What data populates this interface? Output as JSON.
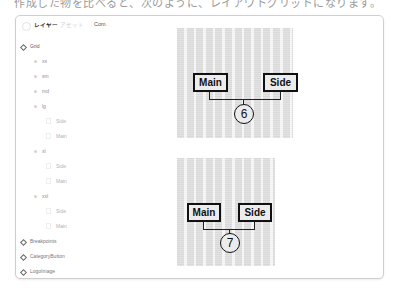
{
  "top_cut_text": "作成した物を比べると、次のように、レイアウトグリッドになります。",
  "header": {
    "tabs": [
      {
        "label": "レイヤー",
        "active": true
      },
      {
        "label": "アセット",
        "active": false
      }
    ],
    "chip_label": "Com",
    "chip_ellipsis": "..."
  },
  "tree": {
    "items": [
      {
        "label": "Grid",
        "level": 0,
        "icon": "component-icon"
      },
      {
        "label": "xs",
        "level": 1,
        "icon": "dot-icon"
      },
      {
        "label": "sm",
        "level": 1,
        "icon": "dot-icon"
      },
      {
        "label": "md",
        "level": 1,
        "icon": "dot-icon"
      },
      {
        "label": "lg",
        "level": 1,
        "icon": "dot-icon"
      },
      {
        "label": "Side",
        "level": 2,
        "icon": "frame-icon"
      },
      {
        "label": "Main",
        "level": 2,
        "icon": "frame-icon"
      },
      {
        "label": "xl",
        "level": 1,
        "icon": "dot-icon"
      },
      {
        "label": "Side",
        "level": 2,
        "icon": "frame-icon"
      },
      {
        "label": "Main",
        "level": 2,
        "icon": "frame-icon"
      },
      {
        "label": "xxl",
        "level": 1,
        "icon": "dot-icon"
      },
      {
        "label": "Side",
        "level": 2,
        "icon": "frame-icon"
      },
      {
        "label": "Main",
        "level": 2,
        "icon": "frame-icon"
      },
      {
        "label": "Breakpoints",
        "level": 0,
        "icon": "component-icon"
      },
      {
        "label": "CategoryButton",
        "level": 0,
        "icon": "component-icon"
      },
      {
        "label": "LogoImage",
        "level": 0,
        "icon": "component-icon"
      }
    ]
  },
  "canvas": {
    "diagrams": [
      {
        "main_label": "Main",
        "side_label": "Side",
        "number": "6"
      },
      {
        "main_label": "Main",
        "side_label": "Side",
        "number": "7"
      }
    ]
  }
}
